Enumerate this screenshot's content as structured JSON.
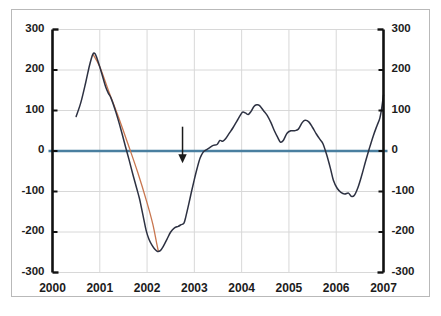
{
  "chart_data": {
    "type": "line",
    "title": "",
    "subtitle": "",
    "xlabel": "",
    "ylabel": "",
    "xlim": [
      2000,
      2007
    ],
    "ylim": [
      -300,
      300
    ],
    "grid": true,
    "legend": "none",
    "x_tick_labels": [
      "2000",
      "2001",
      "2002",
      "2003",
      "2004",
      "2005",
      "2006",
      "2007"
    ],
    "x_ticks": [
      2000,
      2001,
      2002,
      2003,
      2004,
      2005,
      2006,
      2007
    ],
    "y_tick_labels_left": [
      "300",
      "200",
      "100",
      "0",
      "-100",
      "-200",
      "-300"
    ],
    "y_tick_labels_right": [
      "300",
      "200",
      "100",
      "0",
      "-100",
      "-200",
      "-300"
    ],
    "y_ticks": [
      300,
      200,
      100,
      0,
      -100,
      -200,
      -300
    ],
    "colors": {
      "series_main": "#2d3142",
      "series_secondary": "#c8764f",
      "zero_line": "#4a7fa0",
      "grid": "#d8d8d8",
      "axis": "#111111",
      "frame": "#b9b9b9",
      "annotation_arrow": "#1a1a1a",
      "background": "#ffffff"
    },
    "series": [
      {
        "name": "main-series",
        "color": "#2d3142",
        "points": [
          [
            2000.5,
            85
          ],
          [
            2000.6,
            120
          ],
          [
            2000.7,
            168
          ],
          [
            2000.78,
            210
          ],
          [
            2000.85,
            238
          ],
          [
            2000.9,
            240
          ],
          [
            2000.96,
            222
          ],
          [
            2001.04,
            192
          ],
          [
            2001.12,
            160
          ],
          [
            2001.18,
            143
          ],
          [
            2001.24,
            130
          ],
          [
            2001.34,
            96
          ],
          [
            2001.45,
            52
          ],
          [
            2001.55,
            8
          ],
          [
            2001.62,
            -22
          ],
          [
            2001.7,
            -58
          ],
          [
            2001.78,
            -92
          ],
          [
            2001.84,
            -118
          ],
          [
            2001.88,
            -140
          ],
          [
            2001.93,
            -168
          ],
          [
            2001.98,
            -196
          ],
          [
            2002.04,
            -218
          ],
          [
            2002.1,
            -232
          ],
          [
            2002.16,
            -242
          ],
          [
            2002.22,
            -248
          ],
          [
            2002.28,
            -246
          ],
          [
            2002.34,
            -236
          ],
          [
            2002.42,
            -218
          ],
          [
            2002.5,
            -200
          ],
          [
            2002.58,
            -190
          ],
          [
            2002.66,
            -186
          ],
          [
            2002.72,
            -182
          ],
          [
            2002.78,
            -178
          ],
          [
            2002.82,
            -162
          ],
          [
            2002.88,
            -132
          ],
          [
            2002.94,
            -100
          ],
          [
            2003.0,
            -70
          ],
          [
            2003.06,
            -42
          ],
          [
            2003.12,
            -18
          ],
          [
            2003.18,
            -4
          ],
          [
            2003.24,
            2
          ],
          [
            2003.32,
            8
          ],
          [
            2003.4,
            14
          ],
          [
            2003.48,
            16
          ],
          [
            2003.54,
            26
          ],
          [
            2003.6,
            24
          ],
          [
            2003.66,
            30
          ],
          [
            2003.74,
            44
          ],
          [
            2003.82,
            58
          ],
          [
            2003.9,
            74
          ],
          [
            2003.96,
            86
          ],
          [
            2004.02,
            96
          ],
          [
            2004.08,
            94
          ],
          [
            2004.14,
            90
          ],
          [
            2004.2,
            98
          ],
          [
            2004.26,
            110
          ],
          [
            2004.32,
            114
          ],
          [
            2004.38,
            112
          ],
          [
            2004.46,
            100
          ],
          [
            2004.54,
            88
          ],
          [
            2004.62,
            70
          ],
          [
            2004.7,
            48
          ],
          [
            2004.76,
            34
          ],
          [
            2004.82,
            22
          ],
          [
            2004.88,
            26
          ],
          [
            2004.96,
            44
          ],
          [
            2005.04,
            50
          ],
          [
            2005.12,
            50
          ],
          [
            2005.2,
            54
          ],
          [
            2005.28,
            70
          ],
          [
            2005.34,
            76
          ],
          [
            2005.42,
            72
          ],
          [
            2005.5,
            58
          ],
          [
            2005.58,
            42
          ],
          [
            2005.66,
            28
          ],
          [
            2005.72,
            18
          ],
          [
            2005.8,
            -10
          ],
          [
            2005.88,
            -44
          ],
          [
            2005.94,
            -72
          ],
          [
            2006.02,
            -92
          ],
          [
            2006.1,
            -102
          ],
          [
            2006.18,
            -106
          ],
          [
            2006.26,
            -104
          ],
          [
            2006.32,
            -112
          ],
          [
            2006.38,
            -110
          ],
          [
            2006.46,
            -90
          ],
          [
            2006.54,
            -60
          ],
          [
            2006.62,
            -26
          ],
          [
            2006.7,
            6
          ],
          [
            2006.78,
            36
          ],
          [
            2006.86,
            62
          ],
          [
            2006.92,
            80
          ],
          [
            2006.96,
            104
          ],
          [
            2007.0,
            138
          ]
        ]
      },
      {
        "name": "secondary-series",
        "color": "#c8764f",
        "points": [
          [
            2000.86,
            238
          ],
          [
            2001.0,
            208
          ],
          [
            2001.2,
            144
          ],
          [
            2001.4,
            82
          ],
          [
            2001.6,
            16
          ],
          [
            2001.8,
            -52
          ],
          [
            2002.0,
            -128
          ],
          [
            2002.12,
            -180
          ],
          [
            2002.2,
            -226
          ],
          [
            2002.24,
            -248
          ]
        ]
      }
    ],
    "reference_lines": [
      {
        "name": "zero-line",
        "value": 0,
        "orientation": "horizontal",
        "color": "#4a7fa0"
      }
    ],
    "annotations": [
      {
        "name": "down-arrow",
        "type": "arrow",
        "direction": "down",
        "x": 2002.75,
        "y_start": 60,
        "y_end": -30,
        "color": "#1a1a1a"
      }
    ]
  }
}
